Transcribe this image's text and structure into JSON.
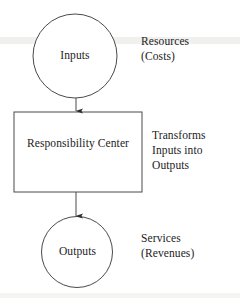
{
  "diagram": {
    "stroke_color": "#4a4a4a",
    "text_color": "#1c1c1c",
    "background_color": "#ffffff",
    "nodes": [
      {
        "id": "inputs",
        "shape": "circle",
        "label": "Inputs",
        "cx": 75,
        "cy": 56,
        "r": 42
      },
      {
        "id": "responsibility-center",
        "shape": "rectangle",
        "label_line1": "Responsibility",
        "label_line2": "Center",
        "x": 14,
        "y": 112,
        "width": 128,
        "height": 80
      },
      {
        "id": "outputs",
        "shape": "circle",
        "label": "Outputs",
        "cx": 77,
        "cy": 252,
        "r": 35.5
      }
    ],
    "arrows": [
      {
        "id": "inputs-to-center",
        "from": "inputs",
        "to": "responsibility-center",
        "x": 76,
        "y1": 98,
        "y2": 112
      },
      {
        "id": "center-to-outputs",
        "from": "responsibility-center",
        "to": "outputs",
        "x": 76,
        "y1": 192,
        "y2": 217
      }
    ],
    "annotations": [
      {
        "id": "resources-costs",
        "lines": [
          "Resources",
          "(Costs)"
        ],
        "relates_to": "inputs"
      },
      {
        "id": "transforms-inputs-into-outputs",
        "lines": [
          "Transforms",
          "Inputs into",
          "Outputs"
        ],
        "relates_to": "responsibility-center"
      },
      {
        "id": "services-revenues",
        "lines": [
          "Services",
          "(Revenues)"
        ],
        "relates_to": "outputs"
      }
    ]
  }
}
